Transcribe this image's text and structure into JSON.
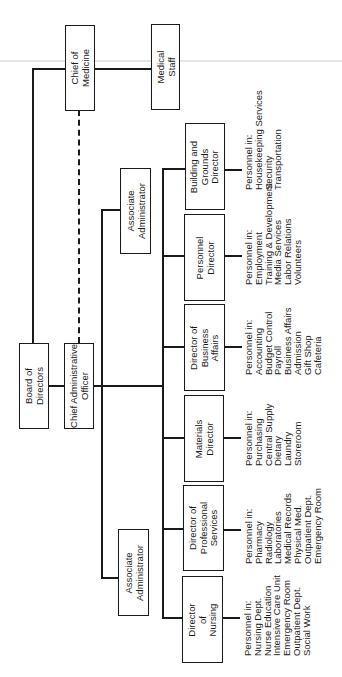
{
  "chart": {
    "orientation": "rotated 90° counter-clockwise",
    "nodes": {
      "board": "Board of\nDirectors",
      "cao": "Chief Administrative\nOfficer",
      "chief_medicine": "Chief of\nMedicine",
      "medical_staff": "Medical\nStaff",
      "assoc_admin_1": "Associate\nAdministrator",
      "assoc_admin_2": "Associate\nAdministrator",
      "building": "Building and\nGrounds\nDirector",
      "personnel": "Personnel\nDirector",
      "business": "Director of\nBusiness\nAffairs",
      "materials": "Materials\nDirector",
      "professional": "Director of\nProfessional\nServices",
      "nursing": "Director\nof\nNursing"
    },
    "personnel_lists": {
      "building": [
        "Personnel in:",
        "Housekeeping Services",
        "Security",
        "Transportation"
      ],
      "personnel": [
        "Personnel in:",
        "Employment",
        "Training & Development",
        "Media Services",
        "Labor Relations",
        "Volunteers"
      ],
      "business": [
        "Personnel in:",
        "Accounting",
        "Budget Control",
        "Payroll",
        "Business Affairs",
        "Admission",
        "Gift Shop",
        "Cafeteria"
      ],
      "materials": [
        "Personnel in:",
        "Purchasing",
        "Central Supply",
        "Dietary",
        "Laundry",
        "Storeroom"
      ],
      "professional": [
        "Personnel in:",
        "Pharmacy",
        "Radiology",
        "Laboratories",
        "Medical Records",
        "Physical Med.",
        "Outpatient Dept.",
        "Emergency Room"
      ],
      "nursing": [
        "Personnel in:",
        "Nursing Dept.",
        "Nurse Education",
        "Intensive Care Unit",
        "Emergency Room",
        "Outpatient Dept.",
        "Social Work"
      ]
    },
    "relationships": [
      {
        "from": "board",
        "to": "cao",
        "type": "solid"
      },
      {
        "from": "board",
        "to": "chief_medicine",
        "type": "solid"
      },
      {
        "from": "chief_medicine",
        "to": "medical_staff",
        "type": "solid"
      },
      {
        "from": "chief_medicine",
        "to": "cao",
        "type": "dashed"
      },
      {
        "from": "cao",
        "to": "assoc_admin_1",
        "type": "solid"
      },
      {
        "from": "cao",
        "to": "assoc_admin_2",
        "type": "solid"
      },
      {
        "from": "cao",
        "to": "building",
        "type": "solid"
      },
      {
        "from": "cao",
        "to": "personnel",
        "type": "solid"
      },
      {
        "from": "cao",
        "to": "business",
        "type": "solid"
      },
      {
        "from": "cao",
        "to": "materials",
        "type": "solid"
      },
      {
        "from": "cao",
        "to": "professional",
        "type": "solid"
      },
      {
        "from": "cao",
        "to": "nursing",
        "type": "solid"
      }
    ]
  }
}
